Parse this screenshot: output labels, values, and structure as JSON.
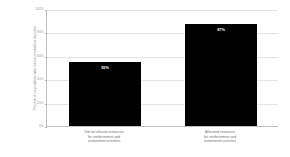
{
  "chart_data": {
    "type": "bar",
    "title": "",
    "xlabel": "",
    "ylabel": "Percent of respondents who met an evaluation objective",
    "ylim": [
      0,
      100
    ],
    "yticks": [
      0,
      20,
      40,
      60,
      80,
      100
    ],
    "ytick_labels": [
      "0%",
      "20%",
      "40%",
      "60%",
      "80%",
      "100%"
    ],
    "grid": true,
    "legend": "none",
    "bar_color": "#000000",
    "categories": [
      "Did not allocate resources\nfor reinforcement and\nsustainment activities",
      "Allocated resources\nfor reinforcement and\nsustainment activities"
    ],
    "values": [
      55,
      87
    ],
    "data_labels": [
      "55%",
      "87%"
    ]
  },
  "axis": {
    "y_title": "Percent of respondents who met an evaluation objective"
  },
  "bars": [
    {
      "label": "55%",
      "category": "Did not allocate resources\nfor reinforcement and\nsustainment activities",
      "value": 55
    },
    {
      "label": "87%",
      "category": "Allocated resources\nfor reinforcement and\nsustainment activities",
      "value": 87
    }
  ],
  "yticks": [
    {
      "label": "100%",
      "value": 100
    },
    {
      "label": "80%",
      "value": 80
    },
    {
      "label": "60%",
      "value": 60
    },
    {
      "label": "40%",
      "value": 40
    },
    {
      "label": "20%",
      "value": 20
    },
    {
      "label": "0%",
      "value": 0
    }
  ]
}
